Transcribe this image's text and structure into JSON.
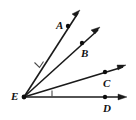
{
  "figure": {
    "background_color": "#ffffff",
    "stroke_color": "#1a1a1a",
    "label_color": "#111111",
    "angle_mark_color": "#4a4a4a",
    "width": 136,
    "height": 120,
    "vertex": {
      "name": "vertex-e",
      "label": "E",
      "x": 24,
      "y": 97,
      "label_x": 11,
      "label_y": 100
    },
    "rays": [
      {
        "name": "ray-ea",
        "label": "A",
        "point_x": 68,
        "point_y": 26,
        "tip_x": 80,
        "tip_y": 11,
        "label_x": 56,
        "label_y": 29,
        "has_arrow": true,
        "has_point_dot": true
      },
      {
        "name": "ray-eb",
        "label": "B",
        "point_x": 82,
        "point_y": 43,
        "tip_x": 100,
        "tip_y": 28,
        "label_x": 81,
        "label_y": 57,
        "has_arrow": true,
        "has_point_dot": true
      },
      {
        "name": "ray-ec",
        "label": "C",
        "point_x": 105,
        "point_y": 72,
        "tip_x": 125,
        "tip_y": 66,
        "label_x": 103,
        "label_y": 87,
        "has_arrow": true,
        "has_point_dot": true
      },
      {
        "name": "ray-ed",
        "label": "D",
        "point_x": 105,
        "point_y": 97,
        "tip_x": 127,
        "tip_y": 97,
        "label_x": 103,
        "label_y": 112,
        "has_arrow": true,
        "has_point_dot": true
      }
    ],
    "angle_marks": [
      {
        "name": "angle-mark-aeb",
        "description": "tick mark between ray EA and ray EB",
        "path": "M 34 63 L 39 68 L 43 63"
      },
      {
        "name": "angle-mark-ced",
        "description": "tick mark between ray EC and ray ED",
        "path": "M 52 91 L 52 97"
      }
    ]
  }
}
